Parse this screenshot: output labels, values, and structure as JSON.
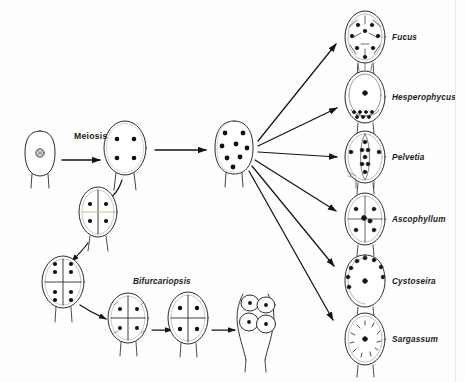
{
  "figure": {
    "domain": "biological-life-cycle-diagram",
    "background_color": "#fefefe",
    "ink_color": "#1a1a1a",
    "width": 465,
    "height": 382
  },
  "process_labels": {
    "meiosis": "Meiosis",
    "bifurcariopsis": "Bifurcariopsis"
  },
  "genera": [
    {
      "id": "fucus",
      "name": "Fucus",
      "eggs": 8,
      "label_x": 392,
      "label_y": 38,
      "cell_cx": 365,
      "cell_cy": 37,
      "rx": 20,
      "ry": 26
    },
    {
      "id": "hesperophycus",
      "name": "Hesperophycus",
      "eggs": 2,
      "label_x": 392,
      "label_y": 98,
      "cell_cx": 365,
      "cell_cy": 97,
      "rx": 20,
      "ry": 26
    },
    {
      "id": "pelvetia",
      "name": "Pelvetia",
      "eggs": 4,
      "label_x": 392,
      "label_y": 158,
      "cell_cx": 365,
      "cell_cy": 157,
      "rx": 20,
      "ry": 26
    },
    {
      "id": "ascophyllum",
      "name": "Ascophyllum",
      "eggs": 4,
      "label_x": 392,
      "label_y": 220,
      "cell_cx": 365,
      "cell_cy": 219,
      "rx": 20,
      "ry": 26
    },
    {
      "id": "cystoseira",
      "name": "Cystoseira",
      "eggs": 1,
      "label_x": 392,
      "label_y": 282,
      "cell_cx": 365,
      "cell_cy": 281,
      "rx": 20,
      "ry": 26
    },
    {
      "id": "sargassum",
      "name": "Sargassum",
      "eggs": 1,
      "label_x": 392,
      "label_y": 340,
      "cell_cx": 365,
      "cell_cy": 339,
      "rx": 20,
      "ry": 26
    }
  ],
  "stages": [
    {
      "id": "oogonium-1n",
      "nuclei": 1,
      "cx": 40,
      "cy": 155
    },
    {
      "id": "oogonium-4n",
      "nuclei": 4,
      "cx": 125,
      "cy": 148
    },
    {
      "id": "oogonium-4n-septate",
      "nuclei": 4,
      "cx": 98,
      "cy": 212
    },
    {
      "id": "oogonium-8n",
      "nuclei": 8,
      "cx": 63,
      "cy": 282
    },
    {
      "id": "oogonium-8n-b",
      "nuclei": 8,
      "cx": 128,
      "cy": 318
    },
    {
      "id": "oogonium-8n-c",
      "nuclei": 8,
      "cx": 188,
      "cy": 318
    },
    {
      "id": "eggs-released",
      "nuclei": 4,
      "cx": 253,
      "cy": 318
    },
    {
      "id": "hub-8n",
      "nuclei": 8,
      "cx": 234,
      "cy": 148
    }
  ],
  "axis_note": ""
}
